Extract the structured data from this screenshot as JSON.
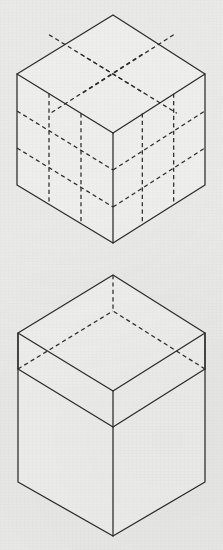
{
  "page": {
    "background_color": "#e9e9e7",
    "line_color": "#2b2b2b",
    "width": 223,
    "height": 550
  },
  "figures": [
    {
      "id": "figure-top",
      "name": "subdivided-cube",
      "description": "Isometric cube subdivided into a 3 by 3 by 3 grid of unit cubes, with internal and hidden edges drawn as dashed lines.",
      "divisions": 3,
      "visible_faces": [
        "top",
        "left",
        "right"
      ],
      "geometry": {
        "apex": [
          113,
          15
        ],
        "left": [
          17,
          74
        ],
        "right": [
          205,
          74
        ],
        "front": [
          113,
          133
        ],
        "bottom_left": [
          17,
          185
        ],
        "bottom_front": [
          113,
          243
        ],
        "bottom_right": [
          205,
          185
        ],
        "vertical_height": 111
      },
      "line_styles": {
        "outline": "solid",
        "grid": "dashed"
      }
    },
    {
      "id": "figure-bottom",
      "name": "tall-box-with-top-slab",
      "description": "Tall isometric rectangular box with the uppermost layer delineated as a separate slab; rear edges of the slab and the rear vertical edge are dashed as hidden lines.",
      "divisions": 1,
      "visible_faces": [
        "top",
        "left",
        "right"
      ],
      "geometry": {
        "apex": [
          113,
          275
        ],
        "left": [
          18,
          333
        ],
        "right": [
          205,
          333
        ],
        "front": [
          113,
          391
        ],
        "slab_left": [
          18,
          369
        ],
        "slab_front": [
          113,
          427
        ],
        "slab_right": [
          205,
          369
        ],
        "bottom_left": [
          18,
          482
        ],
        "bottom_front": [
          113,
          536
        ],
        "bottom_right": [
          205,
          482
        ],
        "slab_height": 36,
        "body_height": 109
      },
      "line_styles": {
        "outline": "solid",
        "hidden": "dashed"
      }
    }
  ]
}
